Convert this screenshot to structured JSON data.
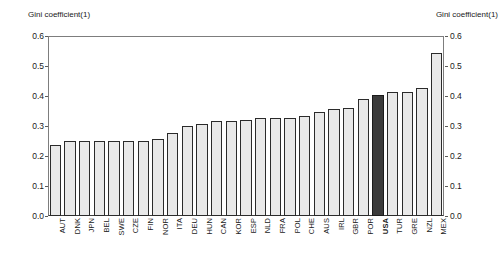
{
  "chart": {
    "type": "bar",
    "title_left": "Gini coefficient(1)",
    "title_right": "Gini coefficient(1)"
  },
  "axis": {
    "y_ticks": [
      "0.0",
      "0.1",
      "0.2",
      "0.3",
      "0.4",
      "0.5",
      "0.6"
    ],
    "y_min": 0.0,
    "y_max": 0.6
  },
  "chart_data": {
    "type": "bar",
    "title": "Gini coefficient(1)",
    "xlabel": "",
    "ylabel": "Gini coefficient(1)",
    "ylim": [
      0.0,
      0.6
    ],
    "yticks": [
      0.0,
      0.1,
      0.2,
      0.3,
      0.4,
      0.5,
      0.6
    ],
    "grid": false,
    "legend": "none",
    "highlight_category": "USA",
    "highlight_color": "#3b3b3b",
    "bar_color": "#e9e9e9",
    "bar_edge_color": "#2b2b2b",
    "categories": [
      "AUT",
      "DNK",
      "JPN",
      "BEL",
      "SWE",
      "CZE",
      "FIN",
      "NOR",
      "ITA",
      "DEU",
      "HUN",
      "CAN",
      "KOR",
      "ESP",
      "NLD",
      "FRA",
      "POL",
      "CHE",
      "AUS",
      "IRL",
      "GBR",
      "POR",
      "USA",
      "TUR",
      "GRE",
      "NZL",
      "MEX"
    ],
    "values": [
      0.237,
      0.25,
      0.25,
      0.25,
      0.25,
      0.25,
      0.25,
      0.257,
      0.277,
      0.3,
      0.307,
      0.317,
      0.317,
      0.32,
      0.327,
      0.327,
      0.327,
      0.333,
      0.347,
      0.357,
      0.36,
      0.39,
      0.403,
      0.413,
      0.413,
      0.427,
      0.543
    ]
  }
}
